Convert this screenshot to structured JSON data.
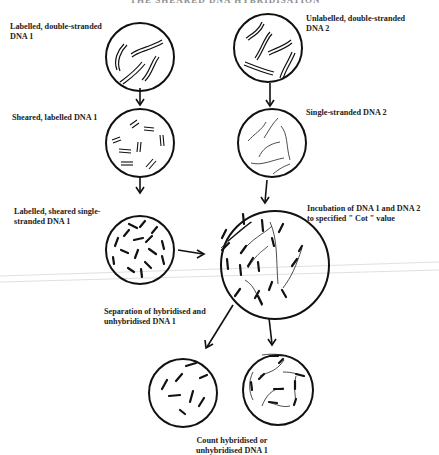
{
  "header": {
    "title": "THE SHEARED DNA HYBRIDISATION"
  },
  "labels": {
    "labelled_ds_dna1": [
      "Labelled, double-stranded",
      "DNA 1"
    ],
    "unlabelled_ds_dna2": [
      "Unlabelled, double-stranded",
      "DNA 2"
    ],
    "sheared_labelled_dna1": "Sheared, labelled DNA 1",
    "single_stranded_dna2": "Single-stranded DNA 2",
    "labelled_sheared_ss_dna1": [
      "Labelled, sheared single-",
      "stranded DNA 1"
    ],
    "incubation": [
      "Incubation of DNA 1 and DNA 2",
      "to specified \" Cot \" value"
    ],
    "separation": [
      "Separation of hybridised and",
      "unhybridised DNA 1"
    ],
    "count": [
      "Count hybridised or",
      "unhybridised DNA 1"
    ]
  },
  "diagram": {
    "nodes": [
      {
        "id": "dna1_ds",
        "label": "Labelled, double-stranded DNA 1"
      },
      {
        "id": "dna2_ds",
        "label": "Unlabelled, double-stranded DNA 2"
      },
      {
        "id": "dna1_sheared",
        "label": "Sheared, labelled DNA 1"
      },
      {
        "id": "dna2_ss",
        "label": "Single-stranded DNA 2"
      },
      {
        "id": "dna1_ss",
        "label": "Labelled, sheared single-stranded DNA 1"
      },
      {
        "id": "incubation",
        "label": "Incubation of DNA 1 and DNA 2 to specified \" Cot \" value"
      },
      {
        "id": "unhybridised",
        "label": "Unhybridised DNA 1"
      },
      {
        "id": "hybridised",
        "label": "Hybridised DNA 1"
      }
    ],
    "edges": [
      {
        "from": "dna1_ds",
        "to": "dna1_sheared"
      },
      {
        "from": "dna1_sheared",
        "to": "dna1_ss"
      },
      {
        "from": "dna2_ds",
        "to": "dna2_ss"
      },
      {
        "from": "dna2_ss",
        "to": "incubation"
      },
      {
        "from": "dna1_ss",
        "to": "incubation"
      },
      {
        "from": "incubation",
        "to": "unhybridised",
        "label": "Separation of hybridised and unhybridised DNA 1"
      },
      {
        "from": "incubation",
        "to": "hybridised"
      }
    ]
  }
}
